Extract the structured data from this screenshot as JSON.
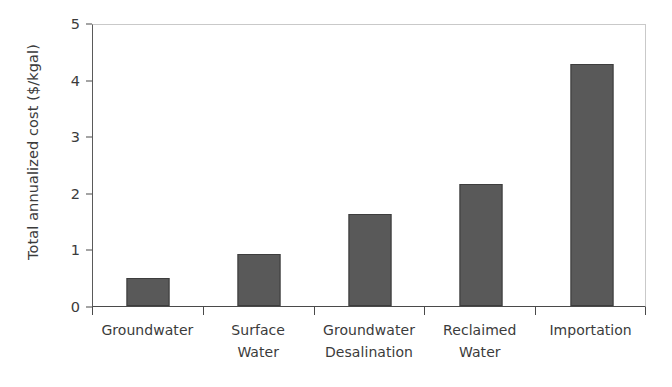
{
  "chart_data": {
    "type": "bar",
    "title": "",
    "xlabel": "",
    "ylabel": "Total annualized cost ($/kgal)",
    "categories": [
      "Groundwater",
      "Surface Water",
      "Groundwater Desalination",
      "Reclaimed Water",
      "Importation"
    ],
    "category_lines": [
      [
        "Groundwater"
      ],
      [
        "Surface",
        "Water"
      ],
      [
        "Groundwater",
        "Desalination"
      ],
      [
        "Reclaimed",
        "Water"
      ],
      [
        "Importation"
      ]
    ],
    "values": [
      0.5,
      0.92,
      1.63,
      2.17,
      4.3
    ],
    "ylim": [
      0,
      5
    ],
    "ytick_labels": [
      "0",
      "1",
      "2",
      "3",
      "4",
      "5"
    ],
    "ytick_values": [
      0,
      1,
      2,
      3,
      4,
      5
    ],
    "grid": false,
    "legend": null,
    "bar_color": "#595959",
    "bar_edge_color": "#3d3d3d",
    "axis_color": "#4a4a4a",
    "frame_color": "#c9c9c9",
    "text_color": "#3b3b3b",
    "background": "#ffffff"
  }
}
